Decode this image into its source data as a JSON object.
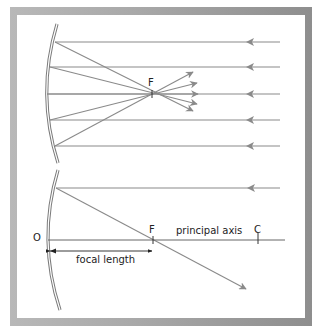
{
  "diagram": {
    "type": "concave-mirror-ray-diagram",
    "colors": {
      "ray": "#8a8a8a",
      "mirror": "#7a7a7a",
      "text": "#222222",
      "frame": "#a5a5a5"
    },
    "top_panel": {
      "focal_label": "F",
      "incident_ray_count": 5
    },
    "bottom_panel": {
      "origin_label": "O",
      "focal_label": "F",
      "center_label": "C",
      "axis_label": "principal axis",
      "dimension_label": "focal length"
    }
  }
}
